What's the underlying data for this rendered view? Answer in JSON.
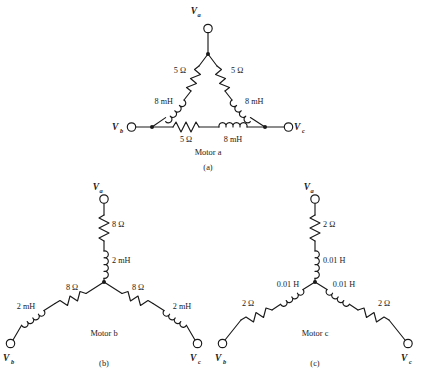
{
  "figure": {
    "background_color": "#ffffff",
    "line_color": "#1a1a1a"
  },
  "circuits": [
    {
      "id": "circuit-a",
      "part_label": "(a)",
      "motor_label": "Motor a",
      "connection": "delta",
      "terminals": [
        {
          "name": "Va",
          "base": "V",
          "sub": "a"
        },
        {
          "name": "Vb",
          "base": "V",
          "sub": "b"
        },
        {
          "name": "Vc",
          "base": "V",
          "sub": "c"
        }
      ],
      "components": [
        {
          "id": "a-r-ab",
          "type": "resistor",
          "value": "5 Ω",
          "branch": "a-b"
        },
        {
          "id": "a-l-ab",
          "type": "inductor",
          "value": "8 mH",
          "branch": "a-b"
        },
        {
          "id": "a-r-ac",
          "type": "resistor",
          "value": "5 Ω",
          "branch": "a-c"
        },
        {
          "id": "a-l-ac",
          "type": "inductor",
          "value": "8 mH",
          "branch": "a-c"
        },
        {
          "id": "a-r-bc",
          "type": "resistor",
          "value": "5 Ω",
          "branch": "b-c"
        },
        {
          "id": "a-l-bc",
          "type": "inductor",
          "value": "8 mH",
          "branch": "b-c"
        }
      ]
    },
    {
      "id": "circuit-b",
      "part_label": "(b)",
      "motor_label": "Motor b",
      "connection": "wye",
      "terminals": [
        {
          "name": "Va",
          "base": "V",
          "sub": "a"
        },
        {
          "name": "Vb",
          "base": "V",
          "sub": "b"
        },
        {
          "name": "Vc",
          "base": "V",
          "sub": "c"
        }
      ],
      "components": [
        {
          "id": "b-r-a",
          "type": "resistor",
          "value": "8 Ω",
          "branch": "a"
        },
        {
          "id": "b-l-a",
          "type": "inductor",
          "value": "2 mH",
          "branch": "a"
        },
        {
          "id": "b-r-b",
          "type": "resistor",
          "value": "8 Ω",
          "branch": "b"
        },
        {
          "id": "b-l-b",
          "type": "inductor",
          "value": "2 mH",
          "branch": "b"
        },
        {
          "id": "b-r-c",
          "type": "resistor",
          "value": "8 Ω",
          "branch": "c"
        },
        {
          "id": "b-l-c",
          "type": "inductor",
          "value": "2 mH",
          "branch": "c"
        }
      ]
    },
    {
      "id": "circuit-c",
      "part_label": "(c)",
      "motor_label": "Motor c",
      "connection": "wye",
      "terminals": [
        {
          "name": "Va",
          "base": "V",
          "sub": "a"
        },
        {
          "name": "Vb",
          "base": "V",
          "sub": "b"
        },
        {
          "name": "Vc",
          "base": "V",
          "sub": "c"
        }
      ],
      "components": [
        {
          "id": "c-r-a",
          "type": "resistor",
          "value": "2 Ω",
          "branch": "a"
        },
        {
          "id": "c-l-a",
          "type": "inductor",
          "value": "0.01 H",
          "branch": "a"
        },
        {
          "id": "c-r-b",
          "type": "resistor",
          "value": "2 Ω",
          "branch": "b"
        },
        {
          "id": "c-l-b",
          "type": "inductor",
          "value": "0.01 H",
          "branch": "b"
        },
        {
          "id": "c-r-c",
          "type": "resistor",
          "value": "2 Ω",
          "branch": "c"
        },
        {
          "id": "c-l-c",
          "type": "inductor",
          "value": "0.01 H",
          "branch": "c"
        }
      ]
    }
  ],
  "labels": {
    "a_top_terminal": "V",
    "a_top_sub": "a",
    "a_left_terminal": "V",
    "a_left_sub": "b",
    "a_right_terminal": "V",
    "a_right_sub": "c",
    "a_r_left": "5 Ω",
    "a_r_right": "5 Ω",
    "a_l_left": "8 mH",
    "a_l_right": "8 mH",
    "a_r_bottom": "5 Ω",
    "a_l_bottom": "8 mH",
    "a_motor": "Motor a",
    "a_part": "(a)",
    "b_top_terminal": "V",
    "b_top_sub": "a",
    "b_left_terminal": "V",
    "b_left_sub": "b",
    "b_right_terminal": "V",
    "b_right_sub": "c",
    "b_r_top": "8 Ω",
    "b_l_top": "2 mH",
    "b_r_left": "8 Ω",
    "b_l_left": "2 mH",
    "b_r_right": "8 Ω",
    "b_l_right": "2 mH",
    "b_motor": "Motor b",
    "b_part": "(b)",
    "c_top_terminal": "V",
    "c_top_sub": "a",
    "c_left_terminal": "V",
    "c_left_sub": "b",
    "c_right_terminal": "V",
    "c_right_sub": "c",
    "c_r_top": "2 Ω",
    "c_l_top": "0.01 H",
    "c_r_left": "2 Ω",
    "c_l_left": "0.01 H",
    "c_r_right": "2 Ω",
    "c_l_right": "0.01 H",
    "c_motor": "Motor c",
    "c_part": "(c)"
  }
}
